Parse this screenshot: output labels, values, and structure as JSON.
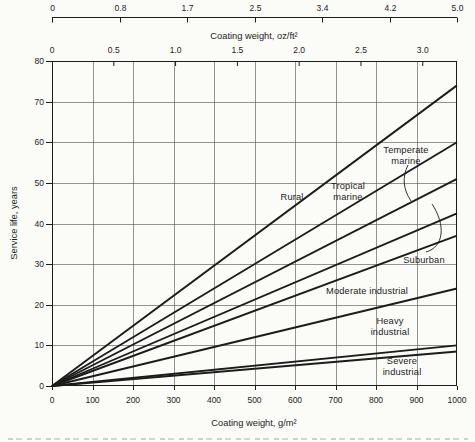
{
  "colors": {
    "ink": "#1c1c1c",
    "paper": "#fbfbf8",
    "grid": "#5a5a5a"
  },
  "figure": {
    "top_scale": {
      "tick_labels": [
        "0",
        "0.8",
        "1.7",
        "2.5",
        "3.4",
        "4.2",
        "5.0"
      ]
    },
    "oz_axis": {
      "label": "Coating weight, oz/ft²",
      "tick_labels": [
        "0",
        "0.5",
        "1.0",
        "1.5",
        "2.0",
        "2.5",
        "3.0"
      ],
      "tick_values": [
        0,
        0.5,
        1.0,
        1.5,
        2.0,
        2.5,
        3.0
      ],
      "g_per_oz": 305.15
    },
    "x_axis": {
      "label": "Coating weight, g/m²",
      "tick_labels": [
        "0",
        "100",
        "200",
        "300",
        "400",
        "500",
        "600",
        "700",
        "800",
        "900",
        "1000"
      ],
      "tick_values": [
        0,
        100,
        200,
        300,
        400,
        500,
        600,
        700,
        800,
        900,
        1000
      ]
    },
    "y_axis": {
      "label": "Service life, years",
      "tick_labels": [
        "0",
        "10",
        "20",
        "30",
        "40",
        "50",
        "60",
        "70",
        "80"
      ],
      "tick_values": [
        0,
        10,
        20,
        30,
        40,
        50,
        60,
        70,
        80
      ]
    }
  },
  "chart_data": {
    "type": "line",
    "title": "",
    "xlabel": "Coating weight, g/m²",
    "x2label": "Coating weight, oz/ft²",
    "ylabel": "Service life, years",
    "xlim": [
      0,
      1000
    ],
    "ylim": [
      0,
      80
    ],
    "grid": true,
    "x_ticks": [
      0,
      100,
      200,
      300,
      400,
      500,
      600,
      700,
      800,
      900,
      1000
    ],
    "y_ticks": [
      0,
      10,
      20,
      30,
      40,
      50,
      60,
      70,
      80
    ],
    "oz_ticks": [
      0,
      0.5,
      1.0,
      1.5,
      2.0,
      2.5,
      3.0
    ],
    "top_scale_ticks": [
      0,
      0.8,
      1.7,
      2.5,
      3.4,
      4.2,
      5.0
    ],
    "series": [
      {
        "name": "Rural",
        "x": [
          0,
          1000
        ],
        "y": [
          0,
          74
        ]
      },
      {
        "name": "Tropical marine",
        "x": [
          0,
          1000
        ],
        "y": [
          0,
          60
        ]
      },
      {
        "name": "Temperate marine",
        "x": [
          0,
          1000
        ],
        "y": [
          0,
          51
        ]
      },
      {
        "name": "Suburban (upper bound)",
        "x": [
          0,
          1000
        ],
        "y": [
          0,
          42.5
        ]
      },
      {
        "name": "Suburban (lower bound)",
        "x": [
          0,
          1000
        ],
        "y": [
          0,
          37
        ]
      },
      {
        "name": "Moderate industrial",
        "x": [
          0,
          1000
        ],
        "y": [
          0,
          24
        ]
      },
      {
        "name": "Heavy industrial",
        "x": [
          0,
          1000
        ],
        "y": [
          0,
          10
        ]
      },
      {
        "name": "Severe industrial",
        "x": [
          0,
          1000
        ],
        "y": [
          0,
          8.5
        ]
      }
    ],
    "annotations": [
      {
        "text": "Rural",
        "x": 240,
        "y": 136
      },
      {
        "text": "Tropical\nmarine",
        "x": 296,
        "y": 131
      },
      {
        "text": "Temperate\nmarine",
        "x": 354,
        "y": 95
      },
      {
        "text": "Suburban",
        "x": 372,
        "y": 199
      },
      {
        "text": "Moderate industrial",
        "x": 315,
        "y": 230
      },
      {
        "text": "Heavy industrial",
        "x": 338,
        "y": 266
      },
      {
        "text": "Severe industrial",
        "x": 350,
        "y": 306
      }
    ],
    "leaders": [
      {
        "name": "temperate-marine-leader",
        "path": "M356,104 C350,116 351,128 359,140"
      },
      {
        "name": "suburban-brace",
        "path": "M374,191 C392,186 394,164 380,143"
      }
    ]
  }
}
